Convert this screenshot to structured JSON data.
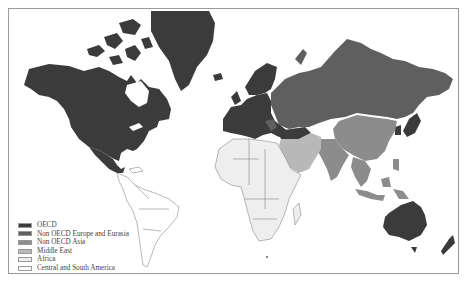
{
  "map": {
    "projection": "Mercator world map",
    "legend": [
      {
        "label": "OECD",
        "color": "#3b3b3b"
      },
      {
        "label": "Non OECD Europe and Eurasia",
        "color": "#5f5f5f"
      },
      {
        "label": "Non OECD Asia",
        "color": "#8c8c8c"
      },
      {
        "label": "Middle East",
        "color": "#b8b8b8"
      },
      {
        "label": "Africa",
        "color": "#eeeeee"
      },
      {
        "label": "Central and South America",
        "color": "#ffffff"
      }
    ]
  }
}
